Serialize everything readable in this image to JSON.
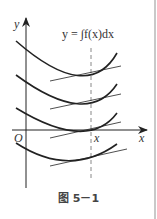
{
  "figure": {
    "caption": "图 5－1",
    "formula": "y = ∫f(x)dx",
    "axis_labels": {
      "y": "y",
      "x": "x",
      "origin": "O",
      "x_marker": "x"
    },
    "colors": {
      "stroke": "#222222",
      "dashed": "#888888",
      "border": "#c9c9c9"
    },
    "curves": [
      {
        "name": "integral-curve-1",
        "path": "M16,41 Q88,104 117,53",
        "tangent": [
          50,
          81,
          121,
          66
        ]
      },
      {
        "name": "integral-curve-2",
        "path": "M16,75 Q88,128 117,84",
        "tangent": [
          50,
          109,
          121,
          94
        ]
      },
      {
        "name": "integral-curve-3",
        "path": "M16,108 Q88,152 117,113",
        "tangent": [
          50,
          138,
          121,
          122
        ]
      },
      {
        "name": "integral-curve-4",
        "path": "M16,143 Q70,178 117,144",
        "tangent": [
          50,
          166,
          127,
          149
        ]
      }
    ]
  }
}
